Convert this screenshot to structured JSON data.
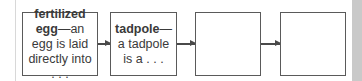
{
  "flowchart": {
    "boxes": [
      {
        "term": "fertilized egg",
        "definition": "—an egg is laid directly into . . ."
      },
      {
        "term": "tadpole",
        "definition": "—a tadpole is a . . ."
      },
      {
        "term": "",
        "definition": ""
      },
      {
        "term": "",
        "definition": ""
      }
    ],
    "arrows": 3
  }
}
